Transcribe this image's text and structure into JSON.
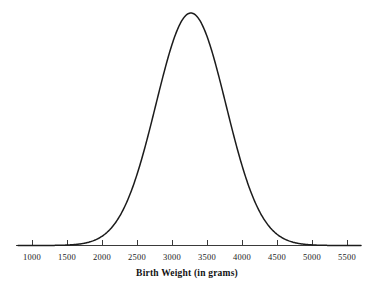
{
  "chart_data": {
    "type": "line",
    "title": "",
    "xlabel": "Birth Weight (in grams)",
    "ylabel": "",
    "xlim": [
      800,
      5700
    ],
    "ylim": [
      0,
      1
    ],
    "grid": false,
    "legend": null,
    "distribution": {
      "shape": "normal",
      "mean": 3270,
      "sd": 500,
      "peak_x": 3270,
      "peak_y": 1
    },
    "xticks": [
      1000,
      1500,
      2000,
      2500,
      3000,
      3500,
      4000,
      4500,
      5000,
      5500
    ],
    "xtick_labels": [
      "1000",
      "1500",
      "2000",
      "2500",
      "3000",
      "3500",
      "4000",
      "4500",
      "5000",
      "5500"
    ],
    "yticks": [],
    "ytick_labels": [],
    "x": [
      800,
      900,
      1000,
      1100,
      1200,
      1300,
      1400,
      1500,
      1600,
      1700,
      1800,
      1900,
      2000,
      2100,
      2200,
      2300,
      2400,
      2500,
      2600,
      2700,
      2800,
      2900,
      3000,
      3100,
      3200,
      3270,
      3300,
      3400,
      3500,
      3600,
      3700,
      3800,
      3900,
      4000,
      4100,
      4200,
      4300,
      4400,
      4500,
      4600,
      4700,
      4800,
      4900,
      5000,
      5100,
      5200,
      5300,
      5400,
      5500,
      5600,
      5700
    ],
    "values": [
      0.0,
      0.0,
      0.0001,
      0.0002,
      0.0005,
      0.0012,
      0.0028,
      0.0063,
      0.0132,
      0.0259,
      0.0477,
      0.0821,
      0.1327,
      0.2014,
      0.2869,
      0.3838,
      0.4831,
      0.5726,
      0.6411,
      0.6802,
      0.6878,
      0.6669,
      0.6243,
      0.5684,
      0.5063,
      0.4674,
      0.4471,
      0.3885,
      0.3321,
      0.2813,
      0.2344,
      0.1928,
      0.1565,
      0.1256,
      0.0996,
      0.0781,
      0.0605,
      0.0463,
      0.035,
      0.0261,
      0.0192,
      0.0139,
      0.01,
      0.0071,
      0.005,
      0.0034,
      0.0023,
      0.0016,
      0.001,
      0.0007,
      0.0004
    ],
    "colors": {
      "curve": "#1c1c1c",
      "axis": "#3a3a3a",
      "text": "#1a1a1a",
      "background": "#ffffff"
    },
    "style": {
      "curve_width": 1.5,
      "axis_width": 1.2,
      "tick_direction": "up",
      "tick_length": 6,
      "fill": false
    }
  },
  "axis": {
    "title": "Birth Weight (in grams)"
  }
}
